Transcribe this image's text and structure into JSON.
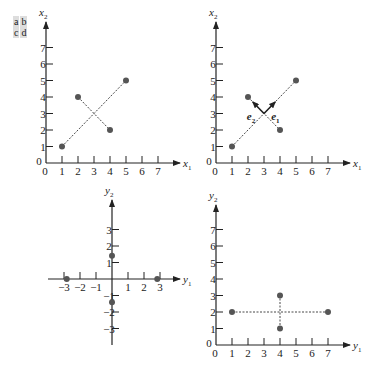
{
  "panel_key": {
    "row1": [
      "a",
      "b"
    ],
    "row2": [
      "c",
      "d"
    ]
  },
  "chart_data": [
    {
      "id": "a",
      "type": "scatter",
      "xlabel": "x1",
      "ylabel": "x2",
      "xticks": [
        0,
        1,
        2,
        3,
        4,
        5,
        6,
        7
      ],
      "yticks": [
        0,
        1,
        2,
        3,
        4,
        5,
        6,
        7
      ],
      "points": [
        [
          1,
          1
        ],
        [
          2,
          4
        ],
        [
          4,
          2
        ],
        [
          5,
          5
        ]
      ],
      "dashed_lines": [
        [
          [
            1,
            1
          ],
          [
            5,
            5
          ]
        ],
        [
          [
            2,
            4
          ],
          [
            4,
            2
          ]
        ]
      ]
    },
    {
      "id": "b",
      "type": "scatter",
      "xlabel": "x1",
      "ylabel": "x2",
      "xticks": [
        0,
        1,
        2,
        3,
        4,
        5,
        6,
        7
      ],
      "yticks": [
        0,
        1,
        2,
        3,
        4,
        5,
        6,
        7
      ],
      "points": [
        [
          1,
          1
        ],
        [
          2,
          4
        ],
        [
          4,
          2
        ],
        [
          5,
          5
        ]
      ],
      "dashed_lines": [
        [
          [
            1,
            1
          ],
          [
            5,
            5
          ]
        ],
        [
          [
            2,
            4
          ],
          [
            4,
            2
          ]
        ]
      ],
      "vectors": [
        {
          "label": "e1",
          "from": [
            3,
            3
          ],
          "to": [
            3.7,
            3.7
          ]
        },
        {
          "label": "e2",
          "from": [
            3,
            3
          ],
          "to": [
            2.3,
            3.7
          ]
        }
      ]
    },
    {
      "id": "c",
      "type": "scatter",
      "xlabel": "y1",
      "ylabel": "y2",
      "xticks": [
        -3,
        -2,
        -1,
        1,
        2,
        3
      ],
      "yticks": [
        -3,
        -2,
        -1,
        1,
        2,
        3
      ],
      "points": [
        [
          -2.83,
          0
        ],
        [
          2.83,
          0
        ],
        [
          0,
          1.41
        ],
        [
          0,
          -1.41
        ]
      ]
    },
    {
      "id": "d",
      "type": "scatter",
      "xlabel": "y1",
      "ylabel": "y2",
      "xticks": [
        0,
        1,
        2,
        3,
        4,
        5,
        6,
        7
      ],
      "yticks": [
        0,
        1,
        2,
        3,
        4,
        5,
        6,
        7
      ],
      "points": [
        [
          1,
          2
        ],
        [
          7,
          2
        ],
        [
          4,
          1
        ],
        [
          4,
          3
        ]
      ],
      "dashed_lines": [
        [
          [
            1,
            2
          ],
          [
            7,
            2
          ]
        ],
        [
          [
            4,
            1
          ],
          [
            4,
            3
          ]
        ]
      ]
    }
  ]
}
